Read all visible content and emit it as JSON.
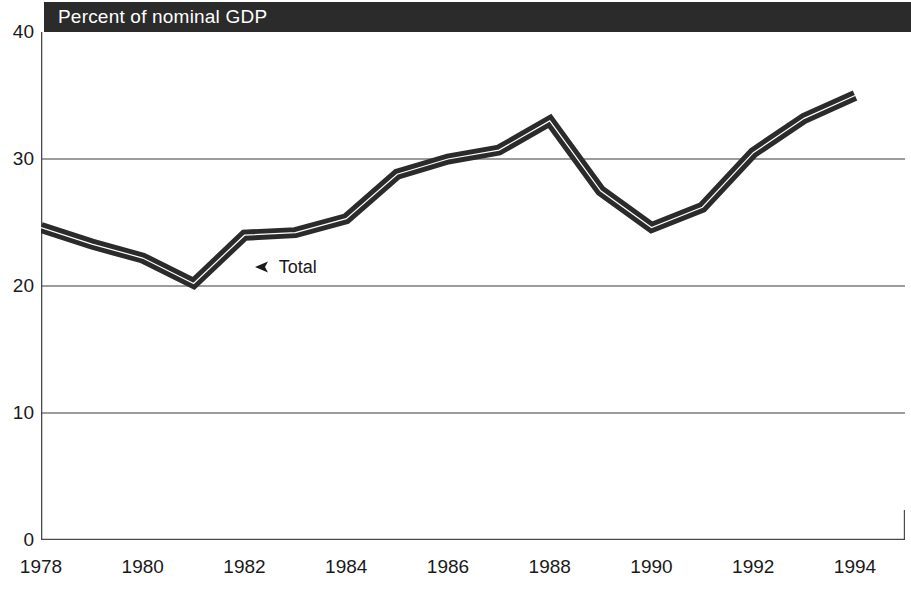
{
  "chart_data": {
    "type": "line",
    "title": "Percent of nominal GDP",
    "subtitle": "",
    "xlabel": "",
    "ylabel": "",
    "xlim": [
      1978,
      1994
    ],
    "ylim": [
      0,
      40
    ],
    "y_ticks": [
      0,
      10,
      20,
      30,
      40
    ],
    "y_tick_labels": [
      "0",
      "10",
      "20",
      "30",
      "40"
    ],
    "x_ticks": [
      1978,
      1980,
      1982,
      1984,
      1986,
      1988,
      1990,
      1992,
      1994
    ],
    "x_tick_labels": [
      "1978",
      "1980",
      "1982",
      "1984",
      "1986",
      "1988",
      "1990",
      "1992",
      "1994"
    ],
    "x": [
      1978,
      1979,
      1980,
      1981,
      1982,
      1983,
      1984,
      1985,
      1986,
      1987,
      1988,
      1989,
      1990,
      1991,
      1992,
      1993,
      1994
    ],
    "series": [
      {
        "name": "Total",
        "values": [
          24.6,
          23.3,
          22.2,
          20.2,
          24.0,
          24.2,
          25.3,
          28.8,
          30.0,
          30.7,
          33.0,
          27.5,
          24.6,
          26.2,
          30.5,
          33.2,
          35.0
        ]
      }
    ],
    "grid": true,
    "gridlines_y": [
      10,
      20,
      30
    ],
    "legend_position": "inline-annotation",
    "annotations": [
      {
        "text": "Total",
        "x": 1982.2,
        "y": 21.5,
        "marker": "left-arrow"
      }
    ]
  },
  "title_banner": {
    "text": "Percent of nominal GDP"
  },
  "colors": {
    "banner_background": "#2b2b2b",
    "banner_text": "#ffffff",
    "series_line": "#2b2b2b",
    "series_highlight": "#ffffff",
    "axis": "#4a4a4a",
    "gridline": "#3a3a3a",
    "plot_background": "#ffffff",
    "tick_label": "#1a1a1a"
  }
}
